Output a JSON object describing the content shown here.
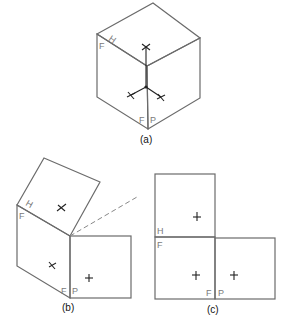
{
  "figures": {
    "a": {
      "caption": "(a)",
      "description": "Isometric cube showing three faces with projection axes",
      "face_labels": {
        "horizontal": "H",
        "frontal": "F",
        "frontal_bottom": "F",
        "profile": "P"
      }
    },
    "b": {
      "caption": "(b)",
      "description": "Cube faces being unfolded; horizontal face rotating open along hinge line",
      "face_labels": {
        "horizontal": "H",
        "frontal": "F",
        "frontal_bottom": "F",
        "profile": "P"
      }
    },
    "c": {
      "caption": "(c)",
      "description": "Faces unfolded flat into orthographic layout",
      "face_labels": {
        "horizontal": "H",
        "frontal": "F",
        "frontal_bottom": "F",
        "profile": "P"
      }
    }
  },
  "colors": {
    "edge": "#6b6b6b",
    "label": "#7a7a7a",
    "ink": "#222222"
  }
}
